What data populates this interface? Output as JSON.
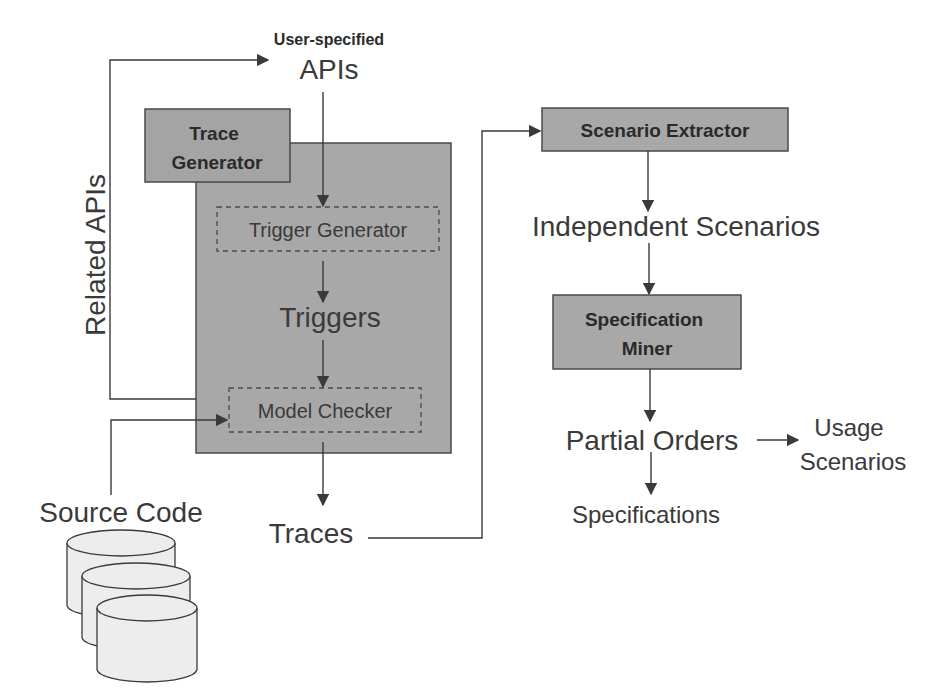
{
  "diagram": {
    "colors": {
      "box_fill": "#a8a8a8",
      "box_stroke": "#4a4a4a",
      "line": "#3a3a3a",
      "text": "#3a3a3a",
      "cylinder_fill": "#ededed"
    },
    "nodes": {
      "user_specified_label": "User-specified",
      "apis": "APIs",
      "related_apis": "Related APIs",
      "trace_generator_line1": "Trace",
      "trace_generator_line2": "Generator",
      "trigger_generator": "Trigger Generator",
      "triggers": "Triggers",
      "model_checker": "Model Checker",
      "source_code": "Source Code",
      "traces": "Traces",
      "scenario_extractor": "Scenario Extractor",
      "independent_scenarios": "Independent Scenarios",
      "specification_miner_line1": "Specification",
      "specification_miner_line2": "Miner",
      "partial_orders": "Partial Orders",
      "usage_scenarios_line1": "Usage",
      "usage_scenarios_line2": "Scenarios",
      "specifications": "Specifications"
    },
    "edges": [
      {
        "from": "User-specified APIs",
        "to": "Trigger Generator"
      },
      {
        "from": "Trigger Generator",
        "to": "Triggers"
      },
      {
        "from": "Triggers",
        "to": "Model Checker"
      },
      {
        "from": "Source Code",
        "to": "Model Checker"
      },
      {
        "from": "Trace Generator",
        "to": "User-specified APIs",
        "label": "Related APIs"
      },
      {
        "from": "Model Checker",
        "to": "Traces"
      },
      {
        "from": "Traces",
        "to": "Scenario Extractor"
      },
      {
        "from": "Scenario Extractor",
        "to": "Independent Scenarios"
      },
      {
        "from": "Independent Scenarios",
        "to": "Specification Miner"
      },
      {
        "from": "Specification Miner",
        "to": "Partial Orders"
      },
      {
        "from": "Partial Orders",
        "to": "Usage Scenarios"
      },
      {
        "from": "Partial Orders",
        "to": "Specifications"
      }
    ]
  }
}
